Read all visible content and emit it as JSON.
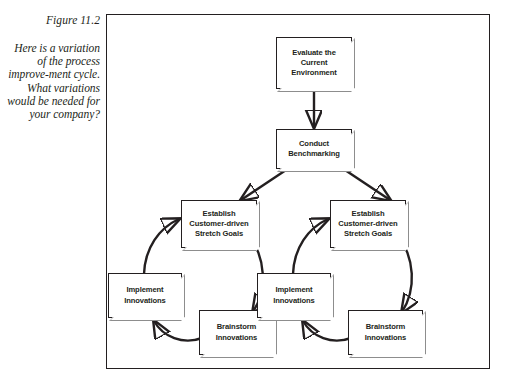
{
  "caption": {
    "figure_label": "Figure 11.2",
    "body": "Here is a variation of the process improve-ment cycle. What variations would be needed for your company?"
  },
  "diagram": {
    "type": "flowchart",
    "orientation": "top-down branching into two identical cycles",
    "nodes": [
      {
        "id": "evaluate",
        "label": "Evaluate the Current Environment"
      },
      {
        "id": "benchmark",
        "label": "Conduct Benchmarking"
      },
      {
        "id": "goals-left",
        "label": "Establish Customer-driven Stretch Goals"
      },
      {
        "id": "implement-left",
        "label": "Implement Innovations"
      },
      {
        "id": "brainstorm-left",
        "label": "Brainstorm Innovations"
      },
      {
        "id": "goals-right",
        "label": "Establish Customer-driven Stretch Goals"
      },
      {
        "id": "implement-right",
        "label": "Implement Innovations"
      },
      {
        "id": "brainstorm-right",
        "label": "Brainstorm Innovations"
      }
    ],
    "edges": [
      {
        "from": "evaluate",
        "to": "benchmark",
        "style": "straight-vertical"
      },
      {
        "from": "benchmark",
        "to": "goals-left",
        "style": "straight-diagonal"
      },
      {
        "from": "benchmark",
        "to": "goals-right",
        "style": "straight-diagonal"
      },
      {
        "from": "goals-left",
        "to": "brainstorm-left",
        "style": "curved"
      },
      {
        "from": "brainstorm-left",
        "to": "implement-left",
        "style": "curved"
      },
      {
        "from": "implement-left",
        "to": "goals-left",
        "style": "curved"
      },
      {
        "from": "goals-right",
        "to": "brainstorm-right",
        "style": "curved"
      },
      {
        "from": "brainstorm-right",
        "to": "implement-right",
        "style": "curved"
      },
      {
        "from": "implement-right",
        "to": "goals-right",
        "style": "curved"
      }
    ],
    "colors": {
      "stroke": "#231f20",
      "fill": "#ffffff",
      "bevel_shadow": "#8d8d8d",
      "page_background": "#ffffff"
    }
  }
}
